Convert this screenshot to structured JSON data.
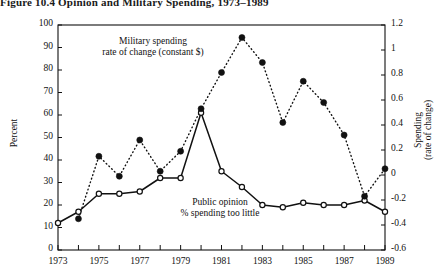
{
  "figure": {
    "caption": "Figure 10.4   Opinion and Military Spending, 1973–1989"
  },
  "axes": {
    "left": {
      "title": "Percent",
      "ticks": [
        "0",
        "10",
        "20",
        "30",
        "40",
        "50",
        "60",
        "70",
        "80",
        "90",
        "100"
      ]
    },
    "right": {
      "title_line1": "Spending",
      "title_line2": "(rate of change)",
      "ticks": [
        "-0.6",
        "-0.4",
        "-0.2",
        "0",
        "0.2",
        "0.4",
        "0.6",
        "0.8",
        "1",
        "1.2"
      ]
    },
    "bottom": {
      "ticks": [
        "1973",
        "1975",
        "1977",
        "1979",
        "1981",
        "1983",
        "1985",
        "1987",
        "1989"
      ]
    }
  },
  "annotations": {
    "military_line1": "Military spending",
    "military_line2": "rate of change (constant $)",
    "public_line1": "Public opinion",
    "public_line2": "% spending too little"
  },
  "colors": {
    "ink": "#111111",
    "background": "#ffffff"
  },
  "chart_data": {
    "type": "line",
    "title": "Figure 10.4   Opinion and Military Spending, 1973–1989",
    "xlabel": "",
    "ylabel": "Percent",
    "y2label": "Spending (rate of change)",
    "xlim": [
      1973,
      1989
    ],
    "ylim": [
      0,
      100
    ],
    "y2lim": [
      -0.6,
      1.2
    ],
    "grid": false,
    "legend": "annotated in-plot",
    "x": [
      1973,
      1974,
      1975,
      1976,
      1977,
      1978,
      1979,
      1980,
      1981,
      1982,
      1983,
      1984,
      1985,
      1986,
      1987,
      1988,
      1989
    ],
    "series": [
      {
        "name": "Public opinion % spending too little",
        "axis": "left",
        "style": "solid line, open circle markers",
        "units": "percent",
        "values": [
          12,
          17,
          25,
          25,
          26,
          32,
          32,
          61,
          35,
          28,
          20,
          19,
          21,
          20,
          20,
          22,
          17
        ]
      },
      {
        "name": "Military spending rate of change (constant $)",
        "axis": "right",
        "style": "dotted line, filled circle markers",
        "units": "rate of change",
        "values": [
          null,
          -0.35,
          0.15,
          -0.01,
          0.28,
          0.03,
          0.19,
          0.53,
          0.82,
          1.1,
          0.9,
          0.42,
          0.75,
          0.58,
          0.32,
          -0.17,
          0.05
        ]
      }
    ]
  }
}
